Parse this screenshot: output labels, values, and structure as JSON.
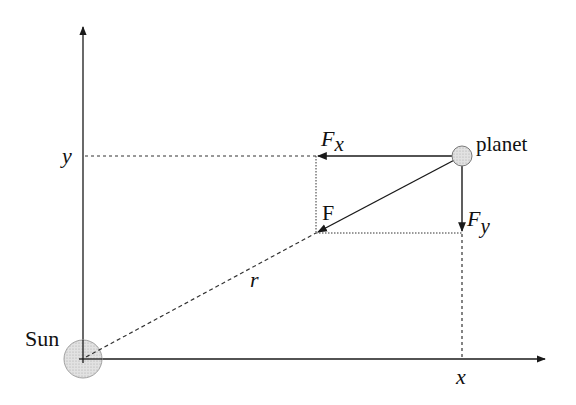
{
  "diagram": {
    "labels": {
      "sun": "Sun",
      "planet": "planet",
      "force": "F",
      "fx_main": "F",
      "fx_sub": "x",
      "fy_main": "F",
      "fy_sub": "y",
      "r": "r",
      "x_axis": "x",
      "y_axis": "y"
    },
    "colors": {
      "line": "#1a1a1a",
      "body_fill": "#d9d9d9",
      "body_stroke": "#9a9a9a"
    },
    "nodes": [
      {
        "id": "sun",
        "label": "Sun",
        "cx": 83,
        "cy": 359,
        "r": 19
      },
      {
        "id": "planet",
        "label": "planet",
        "cx": 462,
        "cy": 156,
        "r": 10
      }
    ],
    "edges": [
      {
        "id": "force-F",
        "from": "planet",
        "to": [
          316,
          233
        ],
        "style": "solid-arrow"
      },
      {
        "id": "force-Fx",
        "from": "planet",
        "to": [
          316,
          156
        ],
        "style": "solid-arrow"
      },
      {
        "id": "force-Fy",
        "from": "planet",
        "to": [
          462,
          233
        ],
        "style": "solid-arrow"
      },
      {
        "id": "r-line",
        "from": "sun",
        "to": [
          316,
          233
        ],
        "style": "dashed"
      }
    ]
  }
}
